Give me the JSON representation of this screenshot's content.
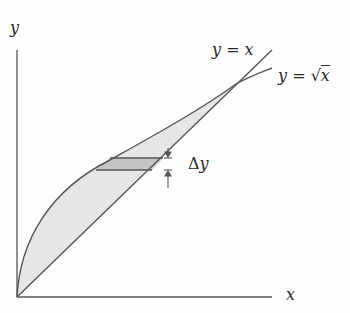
{
  "diagram": {
    "axes": {
      "x_label": "x",
      "y_label": "y"
    },
    "curves": [
      {
        "name": "line",
        "label": "y = x"
      },
      {
        "name": "sqrt",
        "label_prefix": "y = ",
        "label_radicand": "x"
      }
    ],
    "strip": {
      "label_delta": "Δ",
      "label_var": "y"
    },
    "colors": {
      "line": "#555555",
      "region_fill": "#e6e6e6",
      "strip_fill": "#c4c4c4"
    }
  }
}
